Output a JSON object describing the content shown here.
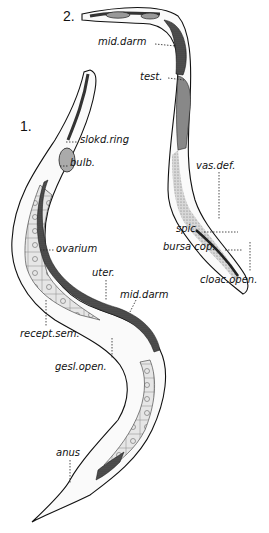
{
  "figure": {
    "background": "#ffffff",
    "ink": "#111111",
    "figures": [
      {
        "number": "1.",
        "subject": "female",
        "labels": [
          {
            "id": "slokd-ring",
            "text": "slokd.ring"
          },
          {
            "id": "bulb",
            "text": "bulb."
          },
          {
            "id": "ovarium",
            "text": "ovarium"
          },
          {
            "id": "uter",
            "text": "uter."
          },
          {
            "id": "mid-darm-1",
            "text": "mid.darm"
          },
          {
            "id": "recept-sem",
            "text": "recept.sem."
          },
          {
            "id": "gesl-open",
            "text": "gesl.open."
          },
          {
            "id": "anus",
            "text": "anus"
          }
        ]
      },
      {
        "number": "2.",
        "subject": "male",
        "labels": [
          {
            "id": "mid-darm-2",
            "text": "mid.darm"
          },
          {
            "id": "test",
            "text": "test."
          },
          {
            "id": "vas-def",
            "text": "vas.def."
          },
          {
            "id": "spic",
            "text": "spic."
          },
          {
            "id": "bursa-cop",
            "text": "bursa cop."
          },
          {
            "id": "cloac-open",
            "text": "cloac.open."
          }
        ]
      }
    ]
  },
  "labels": {
    "fig1_number": "1.",
    "fig2_number": "2.",
    "slokd_ring": "slokd.ring",
    "bulb": "bulb.",
    "ovarium": "ovarium",
    "uter": "uter.",
    "mid_darm_1": "mid.darm",
    "recept_sem": "recept.sem.",
    "gesl_open": "gesl.open.",
    "anus": "anus",
    "mid_darm_2": "mid.darm",
    "test": "test.",
    "vas_def": "vas.def.",
    "spic": "spic.",
    "bursa_cop": "bursa cop.",
    "cloac_open": "cloac.open."
  }
}
